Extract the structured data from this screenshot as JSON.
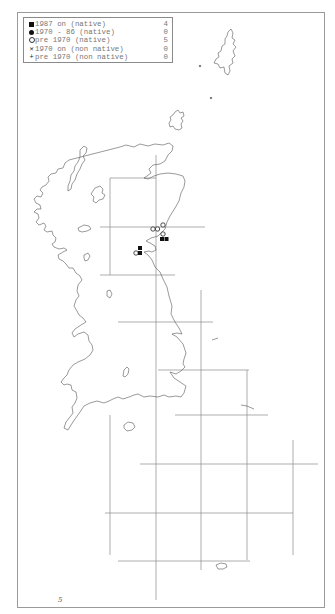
{
  "legend": {
    "rows": [
      {
        "symbol": "filled-square",
        "label": "1987 on (native)",
        "count": "4"
      },
      {
        "symbol": "filled-circle",
        "label": "1970 - 86 (native)",
        "count": "0"
      },
      {
        "symbol": "open-circle",
        "label": "pre 1970 (native)",
        "count": "5"
      },
      {
        "symbol": "cross",
        "label": "1970 on (non native)",
        "count": "0"
      },
      {
        "symbol": "plus",
        "label": "pre 1970 (non native)",
        "count": "0"
      }
    ]
  },
  "map": {
    "region": "Great Britain",
    "grid": {
      "vertical_x": [
        110,
        156,
        201,
        247,
        293
      ],
      "horizontal_y": [
        178,
        227,
        275,
        322,
        370,
        415,
        464,
        513,
        561
      ],
      "color": "#8a8a8a"
    },
    "records": [
      {
        "type": "open-circle",
        "x": 153,
        "y": 229
      },
      {
        "type": "open-circle",
        "x": 157,
        "y": 229
      },
      {
        "type": "open-circle",
        "x": 163,
        "y": 225
      },
      {
        "type": "open-circle",
        "x": 163,
        "y": 234
      },
      {
        "type": "open-circle",
        "x": 136,
        "y": 253
      },
      {
        "type": "filled-square",
        "x": 162,
        "y": 239
      },
      {
        "type": "filled-square",
        "x": 166,
        "y": 239
      },
      {
        "type": "filled-square",
        "x": 140,
        "y": 248
      },
      {
        "type": "filled-square",
        "x": 140,
        "y": 254
      }
    ]
  },
  "footer": {
    "page_mark": "5"
  }
}
